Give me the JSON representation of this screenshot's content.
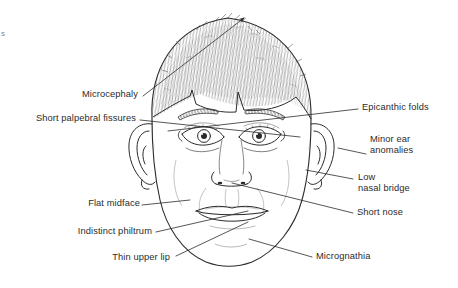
{
  "figure": {
    "kind": "line-drawing-illustration",
    "background_color": "#ffffff",
    "ink_color": "#2b2b2b",
    "corner_mark": "s",
    "width": 458,
    "height": 288
  },
  "annotations": [
    {
      "id": "microcephaly",
      "label": "Microcephaly",
      "side": "left",
      "lines": [
        "Microcephaly"
      ],
      "text_x": 138,
      "text_y": 89,
      "leader_from": [
        143,
        96
      ],
      "leader_to": [
        244,
        18
      ],
      "has_arrowhead": true
    },
    {
      "id": "short-palpebral-fissures",
      "label": "Short palpebral fissures",
      "side": "left",
      "lines": [
        "Short palpebral fissures"
      ],
      "text_x": 136,
      "text_y": 113,
      "leader_from": [
        140,
        120
      ],
      "leader_to": [
        300,
        137
      ],
      "has_arrowhead": false
    },
    {
      "id": "epicanthic-folds",
      "label": "Epicanthic folds",
      "side": "right",
      "lines": [
        "Epicanthic folds"
      ],
      "text_x": 361,
      "text_y": 102,
      "leader_from": [
        358,
        109
      ],
      "leader_to": [
        168,
        131
      ],
      "has_arrowhead": false
    },
    {
      "id": "minor-ear-anomalies",
      "label": "Minor ear anomalies",
      "side": "right",
      "lines": [
        "Minor ear",
        "anomalies"
      ],
      "text_x": 369,
      "text_y": 134,
      "leader_from": [
        366,
        154
      ],
      "leader_to": [
        338,
        148
      ],
      "has_arrowhead": false
    },
    {
      "id": "low-nasal-bridge",
      "label": "Low nasal bridge",
      "side": "right",
      "lines": [
        "Low",
        "nasal bridge"
      ],
      "text_x": 357,
      "text_y": 172,
      "leader_from": [
        353,
        179
      ],
      "leader_to": [
        306,
        170
      ],
      "has_arrowhead": false
    },
    {
      "id": "short-nose",
      "label": "Short nose",
      "side": "right",
      "lines": [
        "Short nose"
      ],
      "text_x": 356,
      "text_y": 207,
      "leader_from": [
        353,
        213
      ],
      "leader_to": [
        232,
        183
      ],
      "has_arrowhead": false
    },
    {
      "id": "flat-midface",
      "label": "Flat midface",
      "side": "left",
      "lines": [
        "Flat midface"
      ],
      "text_x": 80,
      "text_y": 198,
      "leader_from": [
        142,
        205
      ],
      "leader_to": [
        190,
        200
      ],
      "has_arrowhead": false
    },
    {
      "id": "indistinct-philtrum",
      "label": "Indistinct philtrum",
      "side": "left",
      "lines": [
        "Indistinct philtrum"
      ],
      "text_x": 66,
      "text_y": 226,
      "leader_from": [
        156,
        232
      ],
      "leader_to": [
        248,
        211
      ],
      "has_arrowhead": false
    },
    {
      "id": "thin-upper-lip",
      "label": "Thin upper lip",
      "side": "left",
      "lines": [
        "Thin upper lip"
      ],
      "text_x": 116,
      "text_y": 258,
      "leader_from": [
        176,
        256
      ],
      "leader_to": [
        248,
        222
      ],
      "has_arrowhead": false
    },
    {
      "id": "micrognathia",
      "label": "Micrognathia",
      "side": "right",
      "lines": [
        "Micrognathia"
      ],
      "text_x": 315,
      "text_y": 251,
      "leader_from": [
        312,
        257
      ],
      "leader_to": [
        249,
        239
      ],
      "has_arrowhead": false
    }
  ]
}
